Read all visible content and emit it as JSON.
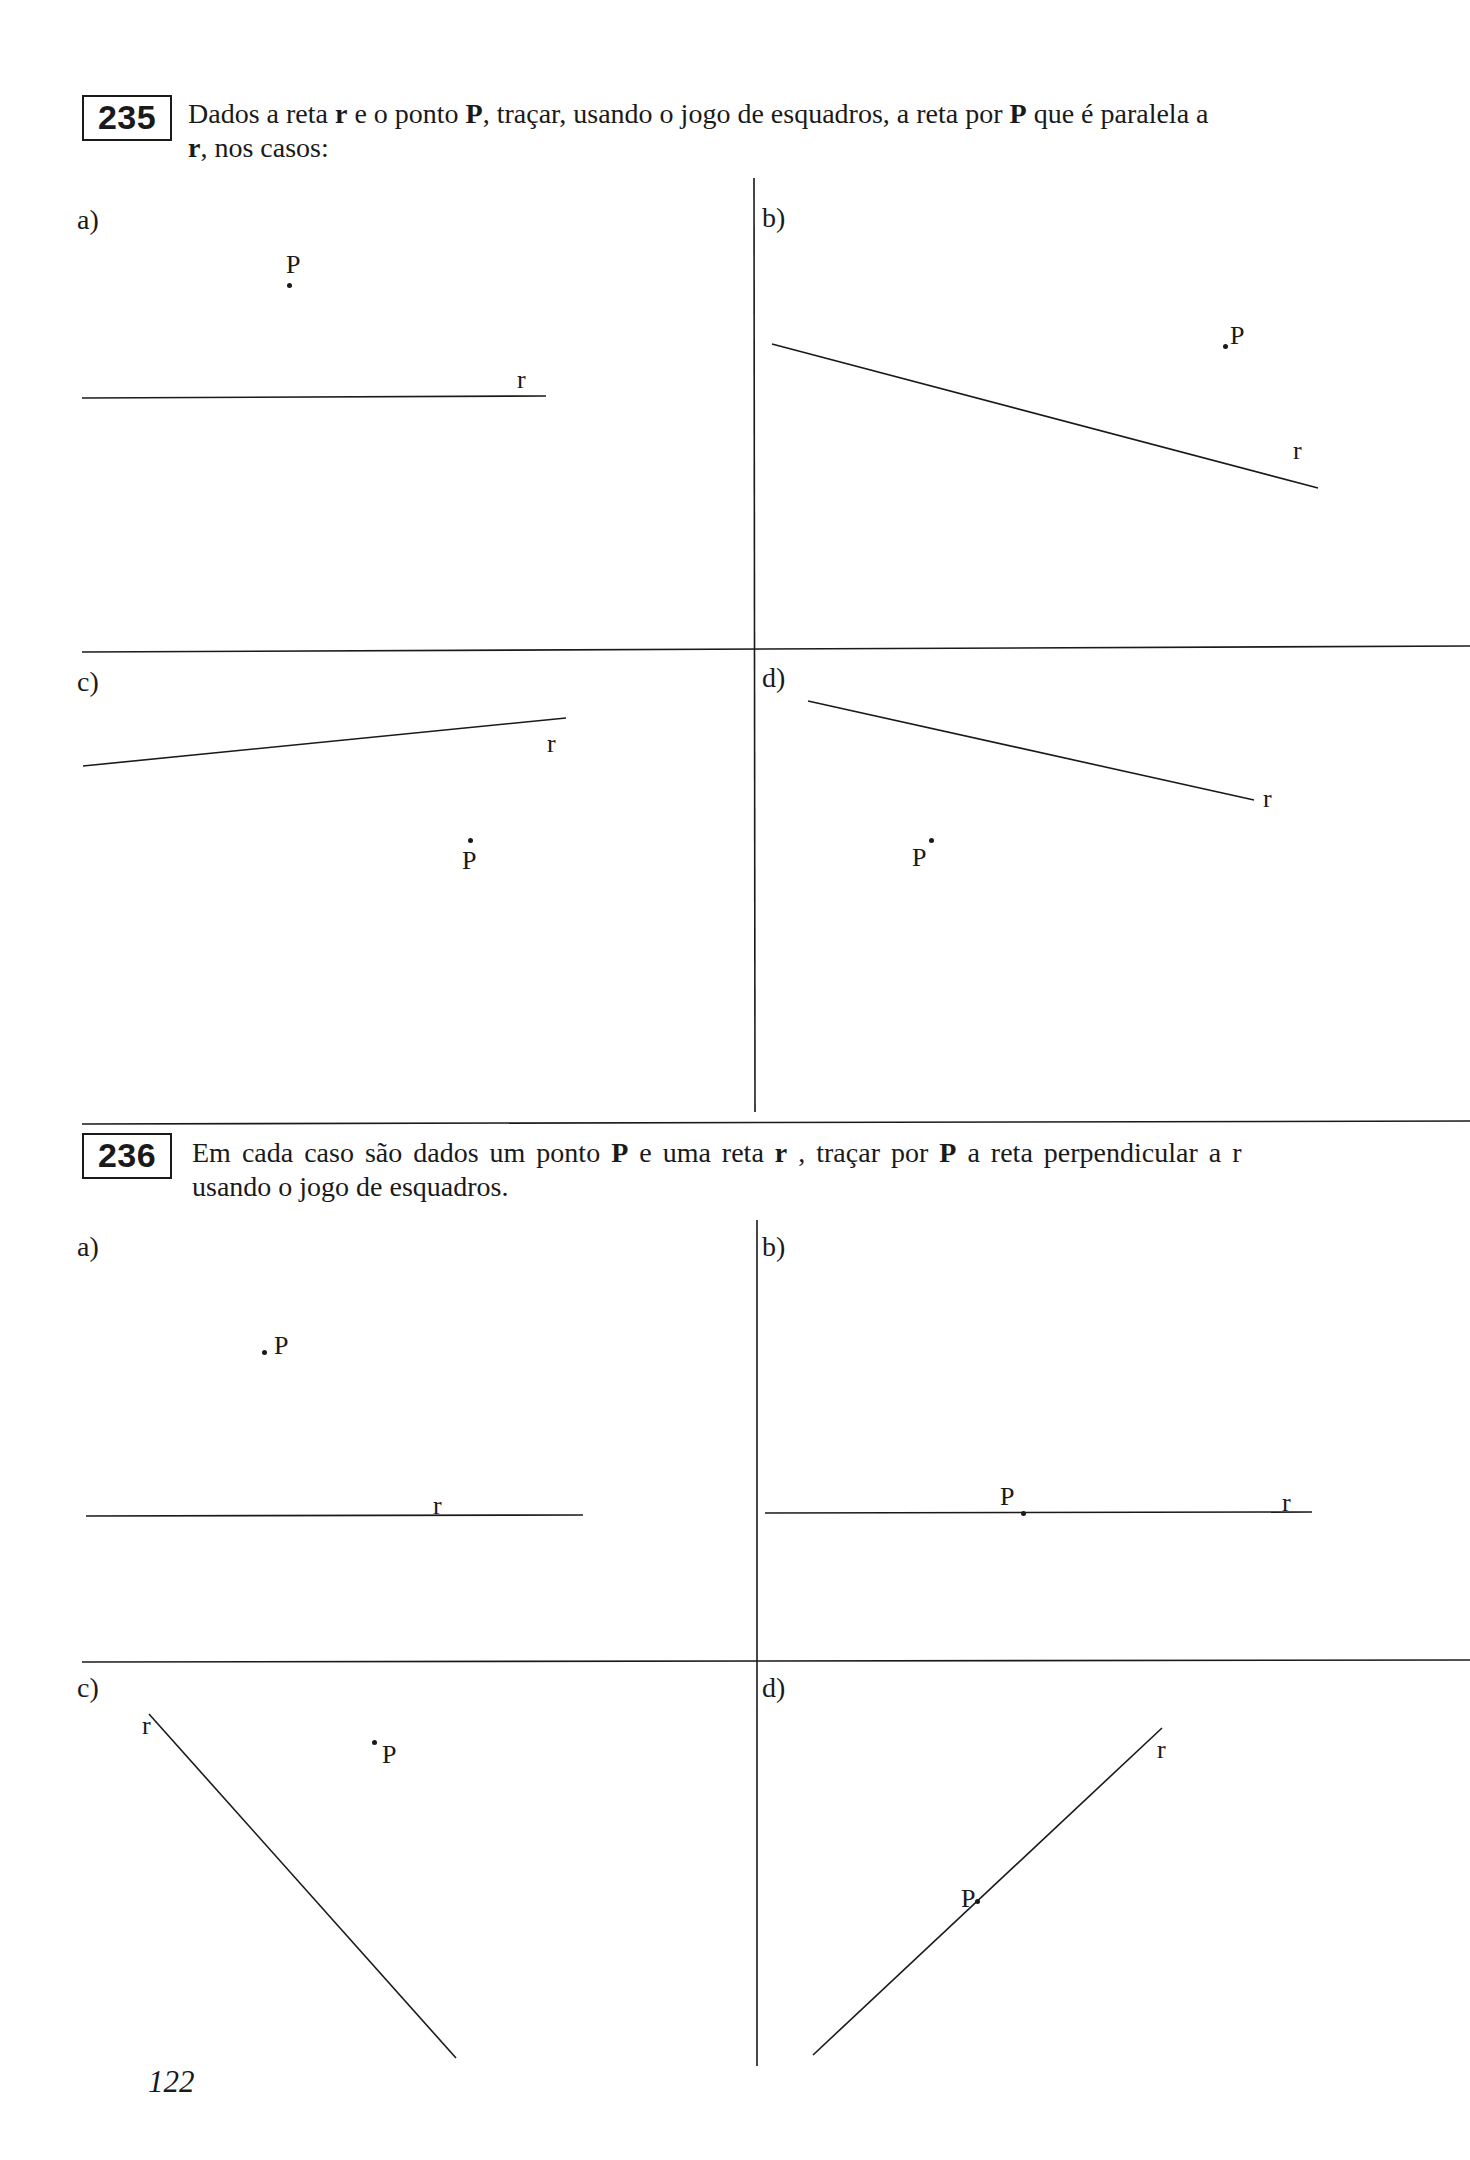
{
  "page_number": "122",
  "exercises": [
    {
      "number": "235",
      "statement_line1": [
        "Dados a reta ",
        "r",
        " e o ponto ",
        "P",
        ", traçar, usando o jogo de esquadros, a reta por ",
        "P",
        " que é paralela a"
      ],
      "statement_line2": [
        "r",
        ", nos casos:"
      ],
      "cases": [
        {
          "label": "a)",
          "line_label": "r",
          "point_label": "P"
        },
        {
          "label": "b)",
          "line_label": "r",
          "point_label": "P"
        },
        {
          "label": "c)",
          "line_label": "r",
          "point_label": "P"
        },
        {
          "label": "d)",
          "line_label": "r",
          "point_label": "P"
        }
      ]
    },
    {
      "number": "236",
      "statement_line1": [
        "Em cada caso são dados um ponto ",
        "P",
        " e uma reta ",
        "r",
        " , traçar por ",
        "P",
        " a reta perpendicular a r"
      ],
      "statement_line2": [
        "usando o jogo de esquadros."
      ],
      "cases": [
        {
          "label": "a)",
          "line_label": "r",
          "point_label": "P"
        },
        {
          "label": "b)",
          "line_label": "r",
          "point_label": "P"
        },
        {
          "label": "c)",
          "line_label": "r",
          "point_label": "P"
        },
        {
          "label": "d)",
          "line_label": "r",
          "point_label": "P"
        }
      ]
    }
  ],
  "colors": {
    "ink": "#1a1a1a",
    "paper": "#ffffff"
  }
}
